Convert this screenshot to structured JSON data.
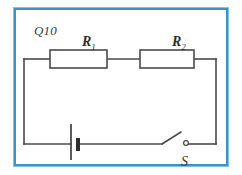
{
  "figure": {
    "question_number": "Q10",
    "border_color": "#3f93bd",
    "wire_color": "#4a4a4a",
    "background": "#ffffff"
  },
  "circuit": {
    "type": "series-circuit",
    "components": [
      {
        "id": "r1",
        "kind": "resistor",
        "label_main": "R",
        "label_sub": "1",
        "position": "top-left"
      },
      {
        "id": "r2",
        "kind": "resistor",
        "label_main": "R",
        "label_sub": "2",
        "position": "top-right"
      },
      {
        "id": "battery",
        "kind": "cell",
        "label_main": "",
        "label_sub": "",
        "position": "bottom-left"
      },
      {
        "id": "switch",
        "kind": "switch-open",
        "label_main": "S",
        "label_sub": "",
        "position": "bottom-right"
      }
    ]
  }
}
